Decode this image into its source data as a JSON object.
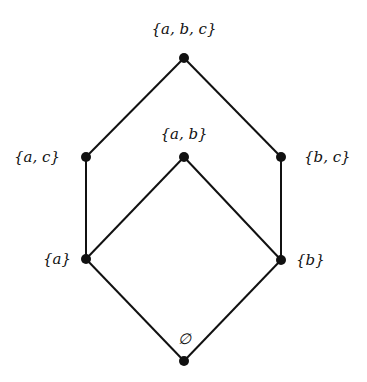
{
  "diagram": {
    "type": "hasse-diagram",
    "nodes": [
      {
        "id": "abc",
        "label": "{a, b, c}",
        "x": 184,
        "y": 58,
        "lx": 184,
        "ly": 34,
        "anchor": "middle"
      },
      {
        "id": "ac",
        "label": "{a, c}",
        "x": 86,
        "y": 157,
        "lx": 60,
        "ly": 162,
        "anchor": "end"
      },
      {
        "id": "ab",
        "label": "{a, b}",
        "x": 184,
        "y": 157,
        "lx": 184,
        "ly": 139,
        "anchor": "middle"
      },
      {
        "id": "bc",
        "label": "{b, c}",
        "x": 281,
        "y": 157,
        "lx": 304,
        "ly": 162,
        "anchor": "start"
      },
      {
        "id": "a",
        "label": "{a}",
        "x": 86,
        "y": 259,
        "lx": 71,
        "ly": 264,
        "anchor": "end"
      },
      {
        "id": "b",
        "label": "{b}",
        "x": 281,
        "y": 260,
        "lx": 296,
        "ly": 265,
        "anchor": "start"
      },
      {
        "id": "empty",
        "label": "∅",
        "x": 184,
        "y": 361,
        "lx": 184,
        "ly": 344,
        "anchor": "middle"
      }
    ],
    "edges": [
      [
        "abc",
        "ac"
      ],
      [
        "abc",
        "bc"
      ],
      [
        "ac",
        "a"
      ],
      [
        "bc",
        "b"
      ],
      [
        "ab",
        "a"
      ],
      [
        "ab",
        "b"
      ],
      [
        "a",
        "empty"
      ],
      [
        "b",
        "empty"
      ]
    ]
  }
}
